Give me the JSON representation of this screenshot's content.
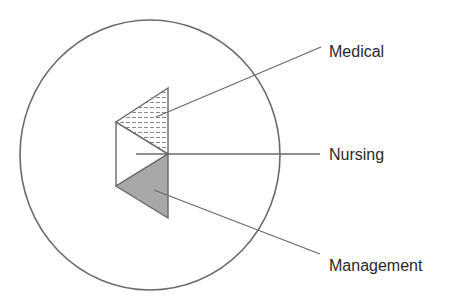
{
  "diagram": {
    "labels": {
      "medical": "Medical",
      "nursing": "Nursing",
      "management": "Management"
    },
    "colors": {
      "stroke": "#6a6a6a",
      "management_fill": "#a8a8a8",
      "medical_hatch": "#8a8a8a",
      "text": "#2a2a2a"
    }
  }
}
